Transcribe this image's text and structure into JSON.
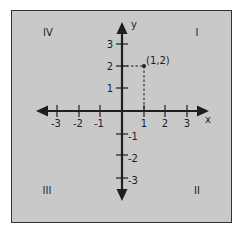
{
  "diagram": {
    "type": "coordinate-plane",
    "axes": {
      "x_label": "x",
      "y_label": "y",
      "x_ticks": [
        {
          "value": -3,
          "label": "-3"
        },
        {
          "value": -2,
          "label": "-2"
        },
        {
          "value": -1,
          "label": "-1"
        },
        {
          "value": 1,
          "label": "1"
        },
        {
          "value": 2,
          "label": "2"
        },
        {
          "value": 3,
          "label": "3"
        }
      ],
      "y_ticks": [
        {
          "value": 3,
          "label": "3"
        },
        {
          "value": 2,
          "label": "2"
        },
        {
          "value": 1,
          "label": "1"
        },
        {
          "value": -1,
          "label": "-1"
        },
        {
          "value": -2,
          "label": "-2"
        },
        {
          "value": -3,
          "label": "-3"
        }
      ]
    },
    "quadrants": {
      "top_left": "IV",
      "top_right": "I",
      "bottom_left": "III",
      "bottom_right": "II"
    },
    "point": {
      "x": 1,
      "y": 2,
      "label": "(1,2)"
    },
    "colors": {
      "background": "#c9c9c9",
      "axis": "#1e1e1e",
      "border": "#333333"
    }
  }
}
